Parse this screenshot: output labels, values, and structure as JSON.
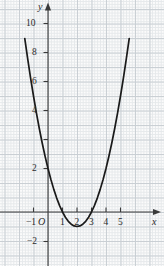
{
  "chart_data": {
    "type": "line",
    "title": "",
    "subtitle": "",
    "xlabel": "x",
    "ylabel": "y",
    "origin_label": "O",
    "xlim": [
      -1.9,
      5.9
    ],
    "ylim": [
      -2.9,
      11.3
    ],
    "grid": true,
    "grid_minor": true,
    "legend": null,
    "annotations": [],
    "series": [
      {
        "name": "y = x^2 - 4x + 3",
        "equation": "y = x^2 - 4x + 3",
        "color": "#1a1a1a",
        "vertex": [
          2,
          -1
        ],
        "roots": [
          1,
          3
        ],
        "y_intercept": 3,
        "x": [
          -1.6,
          -1.4,
          -1.2,
          -1.0,
          -0.8,
          -0.6,
          -0.4,
          -0.2,
          0.0,
          0.2,
          0.4,
          0.6,
          0.8,
          1.0,
          1.2,
          1.4,
          1.6,
          1.8,
          2.0,
          2.2,
          2.4,
          2.6,
          2.8,
          3.0,
          3.2,
          3.4,
          3.6,
          3.8,
          4.0,
          4.2,
          4.4,
          4.6,
          4.8,
          5.0,
          5.2,
          5.4,
          5.6
        ],
        "y": [
          11.96,
          10.56,
          9.24,
          8.0,
          6.84,
          5.76,
          4.76,
          3.84,
          3.0,
          2.24,
          1.56,
          0.96,
          0.44,
          0.0,
          -0.36,
          -0.64,
          -0.84,
          -0.96,
          -1.0,
          -0.96,
          -0.84,
          -0.64,
          -0.36,
          0.0,
          0.44,
          0.96,
          1.56,
          2.24,
          3.0,
          3.84,
          4.76,
          5.76,
          6.84,
          8.0,
          9.24,
          10.56,
          11.96
        ]
      }
    ],
    "x_axis": {
      "tick_values": [
        -1,
        1,
        2,
        3,
        4,
        5
      ],
      "tick_labels": [
        "−1",
        "1",
        "2",
        "3",
        "4",
        "5"
      ],
      "arrow": true
    },
    "y_axis": {
      "tick_values": [
        -2,
        2,
        4,
        6,
        8,
        10
      ],
      "tick_labels": [
        "−2",
        "2",
        "4",
        "6",
        "8",
        "10"
      ],
      "arrow": true
    }
  }
}
